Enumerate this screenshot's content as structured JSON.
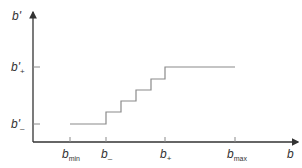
{
  "diagram": {
    "type": "step-function",
    "y_axis": {
      "label": "b'",
      "ticks": [
        {
          "label_base": "b'",
          "label_sub": "+"
        },
        {
          "label_base": "b'",
          "label_sub": "–"
        }
      ]
    },
    "x_axis": {
      "label": "b",
      "ticks": [
        {
          "label_base": "b",
          "label_sub": "min"
        },
        {
          "label_base": "b",
          "label_sub": "–"
        },
        {
          "label_base": "b",
          "label_sub": "+"
        },
        {
          "label_base": "b",
          "label_sub": "max"
        }
      ]
    },
    "colors": {
      "axis": "#333333",
      "curve": "#8a8a8a",
      "text": "#333333"
    }
  }
}
